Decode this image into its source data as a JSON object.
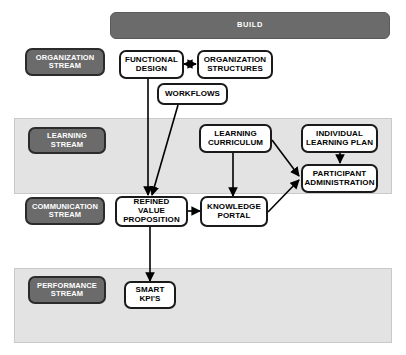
{
  "diagram": {
    "colors": {
      "dark_box": "#6b6b6b",
      "dark_box_border": "#2b2b2b",
      "band_fill": "#e3e3e3",
      "band_border": "#c9c9c9",
      "node_border": "#1a1a1a",
      "node_fill": "#ffffff",
      "connector": "#000000",
      "page_background": "#ffffff"
    },
    "header": {
      "label": "BUILD"
    },
    "bands": [
      {
        "key": "learning_band",
        "label": ""
      },
      {
        "key": "performance_band",
        "label": ""
      }
    ],
    "stream_labels": [
      {
        "key": "organization",
        "label": "ORGANIZATION STREAM"
      },
      {
        "key": "learning",
        "label": "LEARNING STREAM"
      },
      {
        "key": "communication",
        "label": "COMMUNICATION STREAM"
      },
      {
        "key": "performance",
        "label": "PERFORMANCE STREAM"
      }
    ],
    "nodes": [
      {
        "key": "functional_design",
        "label": "FUNCTIONAL DESIGN"
      },
      {
        "key": "organization_structures",
        "label": "ORGANIZATION STRUCTURES"
      },
      {
        "key": "workflows",
        "label": "WORKFLOWS"
      },
      {
        "key": "learning_curriculum",
        "label": "LEARNING CURRICULUM"
      },
      {
        "key": "individual_learning_plan",
        "label": "INDIVIDUAL LEARNING PLAN"
      },
      {
        "key": "participant_administration",
        "label": "PARTICIPANT ADMINISTRATION"
      },
      {
        "key": "refined_value_proposition",
        "label": "REFINED VALUE PROPOSITION"
      },
      {
        "key": "knowledge_portal",
        "label": "KNOWLEDGE PORTAL"
      },
      {
        "key": "smart_kpis",
        "label": "SMART KPI'S"
      }
    ],
    "connectors": [
      {
        "from": "functional_design",
        "to": "organization_structures",
        "type": "double-arrow"
      },
      {
        "from": "functional_design",
        "to": "refined_value_proposition",
        "type": "arrow"
      },
      {
        "from": "workflows",
        "to": "refined_value_proposition",
        "type": "arrow"
      },
      {
        "from": "learning_curriculum",
        "to": "knowledge_portal",
        "type": "arrow"
      },
      {
        "from": "learning_curriculum",
        "to": "participant_administration",
        "type": "arrow"
      },
      {
        "from": "individual_learning_plan",
        "to": "participant_administration",
        "type": "arrow"
      },
      {
        "from": "knowledge_portal",
        "to": "participant_administration",
        "type": "arrow"
      },
      {
        "from": "refined_value_proposition",
        "to": "knowledge_portal",
        "type": "arrow"
      },
      {
        "from": "refined_value_proposition",
        "to": "smart_kpis",
        "type": "arrow"
      }
    ]
  }
}
